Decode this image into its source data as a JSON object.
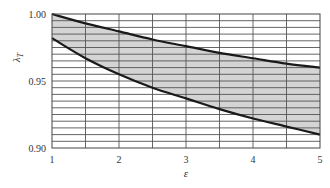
{
  "chart_data": {
    "type": "area",
    "title": "",
    "xlabel": "ε",
    "ylabel": "λ_T",
    "ylabel_main": "λ",
    "ylabel_sub": "T",
    "xlim": [
      1,
      5
    ],
    "ylim": [
      0.9,
      1.0
    ],
    "grid": true,
    "x_ticks": [
      1,
      2,
      3,
      4,
      5
    ],
    "x_tick_labels": [
      "1",
      "2",
      "3",
      "4",
      "5"
    ],
    "x_minor_step": 0.5,
    "y_ticks": [
      0.9,
      0.95,
      1.0
    ],
    "y_tick_labels": [
      "0.90",
      "0.95",
      "1.00"
    ],
    "y_minor_step": 0.005,
    "x": [
      1,
      1.5,
      2,
      2.5,
      3,
      3.5,
      4,
      4.5,
      5
    ],
    "series": [
      {
        "name": "upper bound",
        "values": [
          1.0,
          0.993,
          0.987,
          0.981,
          0.976,
          0.971,
          0.967,
          0.963,
          0.96
        ]
      },
      {
        "name": "lower bound",
        "values": [
          0.982,
          0.967,
          0.955,
          0.945,
          0.937,
          0.929,
          0.922,
          0.916,
          0.91
        ]
      }
    ],
    "fill_between": {
      "color": "#d4d4d4",
      "between": [
        "upper bound",
        "lower bound"
      ]
    },
    "line_color": "#1a1a1a",
    "grid_color": "#555555"
  }
}
